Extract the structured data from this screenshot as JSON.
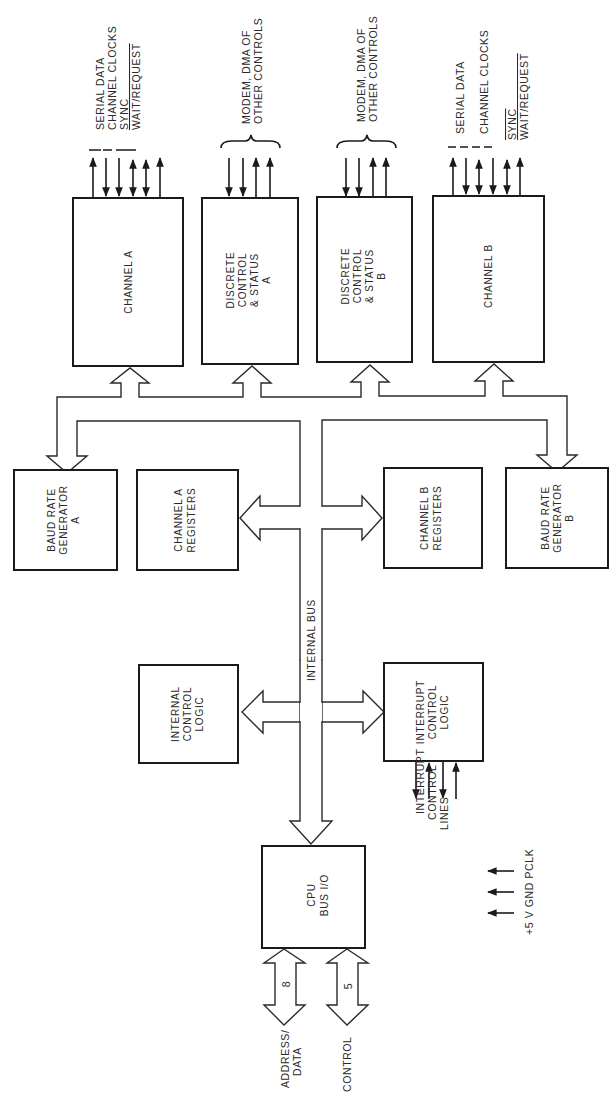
{
  "diagram": {
    "title": "",
    "orientation": "rotated-90-ccw",
    "blocks": {
      "channel_a": {
        "label": [
          "CHANNEL A"
        ]
      },
      "dcs_a": {
        "label": [
          "DISCRETE",
          "CONTROL",
          "& STATUS",
          "A"
        ]
      },
      "dcs_b": {
        "label": [
          "DISCRETE",
          "CONTROL",
          "& STATUS",
          "B"
        ]
      },
      "channel_b": {
        "label": [
          "CHANNEL B"
        ]
      },
      "baud_a": {
        "label": [
          "BAUD RATE",
          "GENERATOR",
          "A"
        ]
      },
      "chan_a_regs": {
        "label": [
          "CHANNEL A",
          "REGISTERS"
        ]
      },
      "chan_b_regs": {
        "label": [
          "CHANNEL B",
          "REGISTERS"
        ]
      },
      "baud_b": {
        "label": [
          "BAUD RATE",
          "GENERATOR",
          "B"
        ]
      },
      "internal_control": {
        "label": [
          "INTERNAL",
          "CONTROL",
          "LOGIC"
        ]
      },
      "interrupt_control": {
        "label": [
          "INTERRUPT",
          "CONTROL",
          "LOGIC"
        ]
      },
      "cpu_bus_io": {
        "label": [
          "CPU",
          "BUS I/O"
        ]
      }
    },
    "buses": {
      "internal_bus": "INTERNAL BUS",
      "address_data": {
        "label": [
          "ADDRESS/",
          "DATA"
        ],
        "width": "8"
      },
      "control": {
        "label": [
          "CONTROL"
        ],
        "width": "5"
      }
    },
    "signals": {
      "channel_a": [
        "SERIAL DATA",
        "CHANNEL CLOCKS",
        "SYNC",
        "WAIT/REQUEST"
      ],
      "dcs_a": [
        "MODEM, DMA OF",
        "OTHER CONTROLS"
      ],
      "dcs_b": [
        "MODEM, DMA OF",
        "OTHER CONTROLS"
      ],
      "channel_b": [
        "SERIAL DATA",
        "CHANNEL CLOCKS",
        "SYNC",
        "WAIT/REQUEST"
      ],
      "interrupt_lines": [
        "INTERRUPT",
        "CONTROL",
        "LINES"
      ],
      "power": "+5 V GND PCLK"
    },
    "colors": {
      "line": "#1a1a1a",
      "background": "#ffffff"
    }
  }
}
